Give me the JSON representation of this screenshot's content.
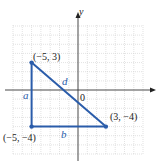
{
  "diagram": {
    "type": "coordinate-plane-right-triangle",
    "axes": {
      "x_label": "",
      "y_label": "y",
      "origin_label": "0",
      "grid_range": {
        "x": [
          -7,
          7
        ],
        "y": [
          -7,
          7
        ]
      }
    },
    "points": [
      {
        "label": "(−5, 3)",
        "x": -5,
        "y": 3
      },
      {
        "label": "(−5, −4)",
        "x": -5,
        "y": -4
      },
      {
        "label": "(3, −4)",
        "x": 3,
        "y": -4
      }
    ],
    "segments": [
      {
        "name": "a",
        "from": "(−5, 3)",
        "to": "(−5, −4)",
        "label": "a"
      },
      {
        "name": "b",
        "from": "(−5, −4)",
        "to": "(3, −4)",
        "label": "b"
      },
      {
        "name": "d",
        "from": "(−5, 3)",
        "to": "(3, −4)",
        "label": "d"
      }
    ],
    "colors": {
      "triangle": "#2a5caa",
      "grid": "#c8c8c8",
      "axis": "#333333"
    }
  }
}
